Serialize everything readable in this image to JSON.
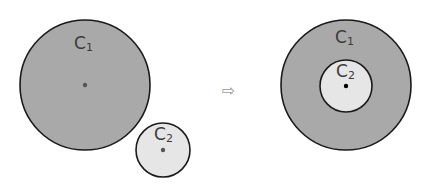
{
  "diagram": {
    "colors": {
      "large_fill": "#a9a9a9",
      "small_fill": "#e6e6e6",
      "stroke": "#1a1a1a",
      "center_dot_left": "#555555",
      "center_dot_right": "#000000"
    },
    "left": {
      "large_circle": {
        "label": "C",
        "subscript": "1",
        "cx": 85,
        "cy": 85,
        "r": 65
      },
      "small_circle": {
        "label": "C",
        "subscript": "2",
        "cx": 163,
        "cy": 150,
        "r": 27
      }
    },
    "arrow": {
      "glyph": "⇨"
    },
    "right": {
      "large_circle": {
        "label": "C",
        "subscript": "1",
        "cx": 346,
        "cy": 85,
        "r": 65
      },
      "small_circle": {
        "label": "C",
        "subscript": "2",
        "cx": 346,
        "cy": 86,
        "r": 26
      }
    }
  }
}
